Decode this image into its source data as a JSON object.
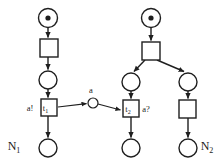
{
  "diagram": {
    "title": "",
    "type": "petri-net",
    "colors": {
      "stroke": "#1f1f1f",
      "fill": "#ffffff",
      "token": "#1f1f1f",
      "background": "#ffffff"
    },
    "net_labels": [
      {
        "id": "N1",
        "base": "N",
        "sub": "1",
        "x": 14,
        "y": 150
      },
      {
        "id": "N2",
        "base": "N",
        "sub": "2",
        "x": 193,
        "y": 150
      }
    ],
    "transition_labels": [
      {
        "id": "t1",
        "base": "t",
        "sub": "1",
        "x": 45,
        "y": 110
      },
      {
        "id": "t2",
        "base": "t",
        "sub": "2",
        "x": 130,
        "y": 110
      }
    ],
    "annotations": [
      {
        "id": "send",
        "text": "a!",
        "x": 30,
        "y": 110
      },
      {
        "id": "channel",
        "text": "a",
        "x": 91,
        "y": 93
      },
      {
        "id": "receive",
        "text": "a?",
        "x": 146,
        "y": 112
      }
    ],
    "places": [
      {
        "id": "p1-initial",
        "cx": 48,
        "cy": 18,
        "r": 9.5,
        "token": true,
        "net": "N1"
      },
      {
        "id": "p1-mid",
        "cx": 48,
        "cy": 80,
        "r": 9.0,
        "token": false,
        "net": "N1"
      },
      {
        "id": "p1-final",
        "cx": 48,
        "cy": 148,
        "r": 9.0,
        "token": false,
        "net": "N1"
      },
      {
        "id": "pc-channel",
        "cx": 93,
        "cy": 103,
        "r": 5.0,
        "token": false,
        "net": "channel"
      },
      {
        "id": "p2-initial",
        "cx": 151,
        "cy": 18,
        "r": 9.5,
        "token": true,
        "net": "N2"
      },
      {
        "id": "p2-left",
        "cx": 131,
        "cy": 82,
        "r": 9.0,
        "token": false,
        "net": "N2"
      },
      {
        "id": "p2-right",
        "cx": 188,
        "cy": 82,
        "r": 9.0,
        "token": false,
        "net": "N2"
      },
      {
        "id": "p2-left-final",
        "cx": 131,
        "cy": 148,
        "r": 9.0,
        "token": false,
        "net": "N2"
      },
      {
        "id": "p2-right-final",
        "cx": 188,
        "cy": 148,
        "r": 9.0,
        "token": false,
        "net": "N2"
      }
    ],
    "transitions": [
      {
        "id": "t1-top",
        "x": 40,
        "y": 39,
        "w": 18,
        "h": 18,
        "label": "",
        "net": "N1"
      },
      {
        "id": "t1",
        "x": 41,
        "y": 99,
        "w": 16,
        "h": 17,
        "label": "t1",
        "net": "N1"
      },
      {
        "id": "t2-top",
        "x": 142,
        "y": 42,
        "w": 18,
        "h": 18,
        "label": "",
        "net": "N2"
      },
      {
        "id": "t2",
        "x": 123,
        "y": 100,
        "w": 16,
        "h": 17,
        "label": "t2",
        "net": "N2"
      },
      {
        "id": "t2-right",
        "x": 179,
        "y": 100,
        "w": 17,
        "h": 18,
        "label": "",
        "net": "N2"
      }
    ],
    "arcs": [
      {
        "id": "arc-p1initial-t1top",
        "from": "p1-initial",
        "to": "t1-top"
      },
      {
        "id": "arc-t1top-p1mid",
        "from": "t1-top",
        "to": "p1-mid"
      },
      {
        "id": "arc-p1mid-t1",
        "from": "p1-mid",
        "to": "t1"
      },
      {
        "id": "arc-t1-p1final",
        "from": "t1",
        "to": "p1-final"
      },
      {
        "id": "arc-t1-channel",
        "from": "t1",
        "to": "pc-channel"
      },
      {
        "id": "arc-channel-t2",
        "from": "pc-channel",
        "to": "t2"
      },
      {
        "id": "arc-p2initial-t2top",
        "from": "p2-initial",
        "to": "t2-top"
      },
      {
        "id": "arc-t2top-p2left",
        "from": "t2-top",
        "to": "p2-left"
      },
      {
        "id": "arc-t2top-p2right",
        "from": "t2-top",
        "to": "p2-right"
      },
      {
        "id": "arc-p2left-t2",
        "from": "p2-left",
        "to": "t2"
      },
      {
        "id": "arc-t2-p2leftfinal",
        "from": "t2",
        "to": "p2-left-final"
      },
      {
        "id": "arc-p2right-t2right",
        "from": "p2-right",
        "to": "t2-right"
      },
      {
        "id": "arc-t2right-p2rightfinal",
        "from": "t2-right",
        "to": "p2-right-final"
      }
    ]
  }
}
